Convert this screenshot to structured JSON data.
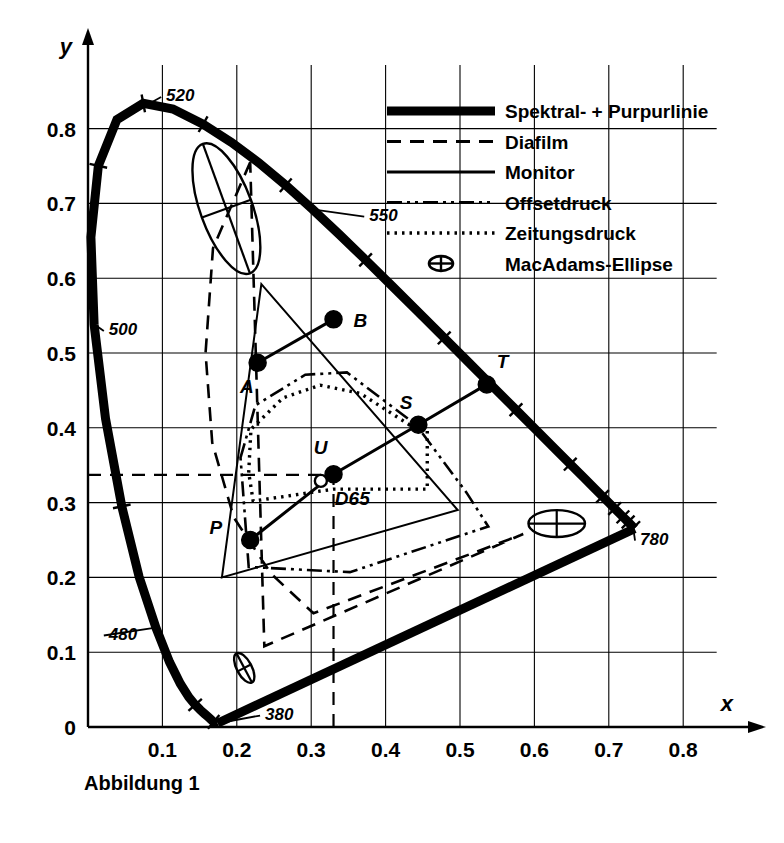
{
  "figure": {
    "caption": "Abbildung 1",
    "x_axis_name": "x",
    "y_axis_name": "y",
    "origin_label": "0"
  },
  "chart_data": {
    "type": "scatter",
    "title": "",
    "subtitle": "",
    "xlabel": "x",
    "ylabel": "y",
    "xlim": [
      0,
      0.84
    ],
    "ylim": [
      0,
      0.88
    ],
    "grid": true,
    "legend_position": "top-right",
    "xticks": [
      "0.1",
      "0.2",
      "0.3",
      "0.4",
      "0.5",
      "0.6",
      "0.7",
      "0.8"
    ],
    "xtick_values": [
      0.1,
      0.2,
      0.3,
      0.4,
      0.5,
      0.6,
      0.7,
      0.8
    ],
    "yticks": [
      "0.1",
      "0.2",
      "0.3",
      "0.4",
      "0.5",
      "0.6",
      "0.7",
      "0.8"
    ],
    "ytick_values": [
      0.1,
      0.2,
      0.3,
      0.4,
      0.5,
      0.6,
      0.7,
      0.8
    ],
    "legend": [
      {
        "label": "Spektral- + Purpurlinie",
        "style": "thick-solid"
      },
      {
        "label": "Diafilm",
        "style": "dashed"
      },
      {
        "label": "Monitor",
        "style": "solid"
      },
      {
        "label": "Offsetdruck",
        "style": "dash-dot-dot"
      },
      {
        "label": "Zeitungsdruck",
        "style": "dotted"
      },
      {
        "label": "MacAdams-Ellipse",
        "style": "ellipse-marker"
      }
    ],
    "wavelength_labels": [
      {
        "text": "520",
        "x": 0.105,
        "y": 0.845,
        "anchor_x": 0.085,
        "anchor_y": 0.835
      },
      {
        "text": "550",
        "x": 0.378,
        "y": 0.685,
        "anchor_x": 0.302,
        "anchor_y": 0.692
      },
      {
        "text": "500",
        "x": 0.028,
        "y": 0.532,
        "anchor_x": 0.009,
        "anchor_y": 0.538
      },
      {
        "text": "480",
        "x": 0.028,
        "y": 0.125,
        "anchor_x": 0.091,
        "anchor_y": 0.133
      },
      {
        "text": "380",
        "x": 0.238,
        "y": 0.018,
        "anchor_x": 0.175,
        "anchor_y": 0.005
      },
      {
        "text": "780",
        "x": 0.742,
        "y": 0.252,
        "anchor_x": 0.733,
        "anchor_y": 0.265
      }
    ],
    "points": [
      {
        "name": "A",
        "x": 0.228,
        "y": 0.487,
        "marker": "filled",
        "label_dx": -4,
        "label_dy": 30
      },
      {
        "name": "B",
        "x": 0.33,
        "y": 0.545,
        "marker": "filled",
        "label_dx": 20,
        "label_dy": 8
      },
      {
        "name": "P",
        "x": 0.218,
        "y": 0.25,
        "marker": "filled",
        "label_dx": -28,
        "label_dy": -6
      },
      {
        "name": "S",
        "x": 0.444,
        "y": 0.404,
        "marker": "filled",
        "label_dx": -6,
        "label_dy": -16
      },
      {
        "name": "T",
        "x": 0.536,
        "y": 0.458,
        "marker": "filled",
        "label_dx": 10,
        "label_dy": -16
      },
      {
        "name": "U",
        "x": 0.33,
        "y": 0.338,
        "marker": "filled",
        "label_dx": -6,
        "label_dy": -20
      },
      {
        "name": "D65",
        "x": 0.313,
        "y": 0.329,
        "marker": "open",
        "label_dx": 14,
        "label_dy": 24
      }
    ],
    "series": [
      {
        "name": "Spektrallinie",
        "style": "thick-solid",
        "x": [
          0.1741,
          0.174,
          0.1738,
          0.1736,
          0.1733,
          0.173,
          0.1726,
          0.1721,
          0.1714,
          0.1703,
          0.1689,
          0.1669,
          0.1644,
          0.1611,
          0.1566,
          0.151,
          0.144,
          0.1355,
          0.1241,
          0.1096,
          0.0913,
          0.0687,
          0.0454,
          0.0235,
          0.0082,
          0.0039,
          0.0139,
          0.0389,
          0.0743,
          0.1142,
          0.1547,
          0.1929,
          0.2296,
          0.2658,
          0.3016,
          0.3373,
          0.3731,
          0.4087,
          0.4441,
          0.4788,
          0.5125,
          0.5448,
          0.5752,
          0.6029,
          0.627,
          0.6482,
          0.6658,
          0.6801,
          0.6915,
          0.7006,
          0.7079,
          0.714,
          0.719,
          0.723,
          0.726,
          0.73,
          0.7334,
          0.7344,
          0.7347
        ],
        "y": [
          0.005,
          0.005,
          0.0049,
          0.0049,
          0.0048,
          0.0048,
          0.0048,
          0.0048,
          0.0051,
          0.0058,
          0.0069,
          0.0086,
          0.0109,
          0.0138,
          0.0177,
          0.0227,
          0.0297,
          0.0399,
          0.0578,
          0.0868,
          0.1327,
          0.2007,
          0.295,
          0.4127,
          0.5384,
          0.6548,
          0.7502,
          0.812,
          0.8338,
          0.8262,
          0.8059,
          0.7816,
          0.7543,
          0.7243,
          0.6923,
          0.6589,
          0.6245,
          0.5896,
          0.5547,
          0.5202,
          0.4866,
          0.4544,
          0.4242,
          0.3965,
          0.3725,
          0.3514,
          0.334,
          0.3197,
          0.3083,
          0.2993,
          0.292,
          0.2859,
          0.2809,
          0.277,
          0.274,
          0.27,
          0.2666,
          0.2656,
          0.2653
        ]
      },
      {
        "name": "Purpurlinie",
        "style": "thick-solid",
        "x": [
          0.7347,
          0.1741
        ],
        "y": [
          0.2653,
          0.005
        ]
      },
      {
        "name": "Diafilm",
        "style": "dashed",
        "x": [
          0.218,
          0.168,
          0.158,
          0.167,
          0.196,
          0.246,
          0.303,
          0.585,
          0.585,
          0.237,
          0.218
        ],
        "y": [
          0.755,
          0.64,
          0.5,
          0.38,
          0.28,
          0.205,
          0.152,
          0.258,
          0.258,
          0.108,
          0.755
        ],
        "closed": true,
        "note": "Diafilm gamut outline, largest dashed region"
      },
      {
        "name": "Monitor",
        "style": "solid",
        "x": [
          0.233,
          0.497,
          0.18
        ],
        "y": [
          0.592,
          0.29,
          0.2
        ],
        "closed": true,
        "note": "Monitor RGB triangle"
      },
      {
        "name": "Offsetdruck",
        "style": "dash-dot-dot",
        "x": [
          0.205,
          0.225,
          0.292,
          0.348,
          0.441,
          0.509,
          0.538,
          0.352,
          0.216,
          0.205
        ],
        "y": [
          0.36,
          0.43,
          0.471,
          0.474,
          0.404,
          0.313,
          0.268,
          0.207,
          0.214,
          0.36
        ],
        "closed": true,
        "note": "Offsetdruck gamut"
      },
      {
        "name": "Zeitungsdruck",
        "style": "dotted",
        "x": [
          0.216,
          0.219,
          0.262,
          0.312,
          0.366,
          0.432,
          0.456,
          0.456,
          0.33,
          0.222,
          0.216
        ],
        "y": [
          0.34,
          0.398,
          0.44,
          0.457,
          0.446,
          0.404,
          0.399,
          0.318,
          0.318,
          0.302,
          0.34
        ],
        "closed": true,
        "note": "Zeitungsdruck gamut, smallest dotted region"
      },
      {
        "name": "Linie A-B",
        "style": "solid-thick",
        "x": [
          0.228,
          0.33
        ],
        "y": [
          0.487,
          0.545
        ]
      },
      {
        "name": "Linie P-U-S-T",
        "style": "solid-thick",
        "x": [
          0.218,
          0.33,
          0.444,
          0.536
        ],
        "y": [
          0.25,
          0.338,
          0.404,
          0.458
        ]
      }
    ],
    "macadam_ellipses": [
      {
        "cx": 0.186,
        "cy": 0.693,
        "rx": 0.035,
        "ry": 0.092,
        "angle": -20,
        "note": "green region, large"
      },
      {
        "cx": 0.63,
        "cy": 0.272,
        "rx": 0.038,
        "ry": 0.018,
        "angle": 0,
        "note": "red region"
      },
      {
        "cx": 0.21,
        "cy": 0.079,
        "rx": 0.01,
        "ry": 0.022,
        "angle": -28,
        "note": "blue region, small"
      },
      {
        "cx": 0.592,
        "cy": 0.565,
        "rx": 0.026,
        "ry": 0.012,
        "angle": 0,
        "note": "legend marker"
      }
    ],
    "reference_lines": [
      {
        "orientation": "horizontal",
        "value": 0.337,
        "style": "dashed",
        "from_x": 0.0,
        "to_x": 0.33
      },
      {
        "orientation": "vertical",
        "value": 0.33,
        "style": "dashed",
        "from_y": 0.0,
        "to_y": 0.338
      }
    ]
  }
}
